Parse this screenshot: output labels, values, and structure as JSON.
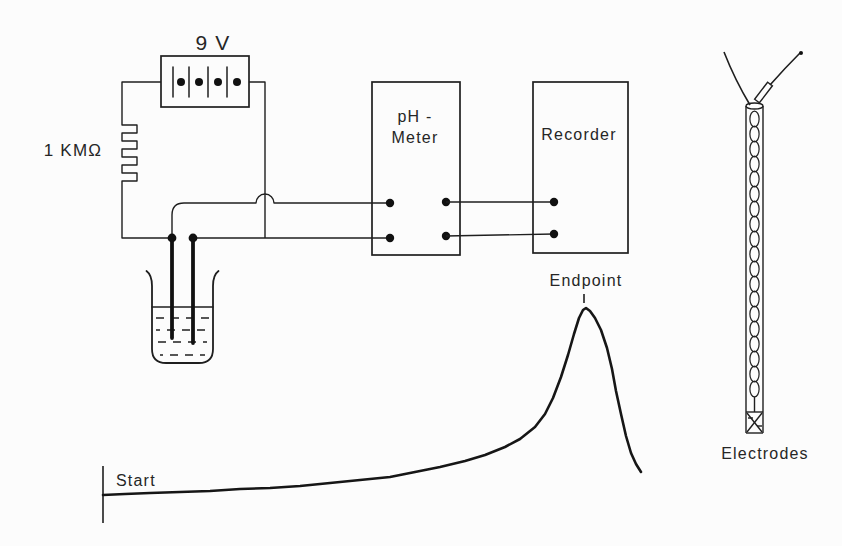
{
  "canvas": {
    "width": 842,
    "height": 546,
    "background": "#fcfcfc",
    "ink": "#1f1f1f"
  },
  "circuit": {
    "battery_label": "9 V",
    "resistor_label": "1 KMΩ",
    "ph_meter": {
      "line1": "pH -",
      "line2": "Meter"
    },
    "recorder": {
      "label": "Recorder"
    }
  },
  "trace": {
    "start_label": "Start",
    "endpoint_label": "Endpoint",
    "points": [
      [
        103,
        495
      ],
      [
        125,
        494
      ],
      [
        150,
        493
      ],
      [
        180,
        492
      ],
      [
        210,
        491
      ],
      [
        240,
        489
      ],
      [
        270,
        488
      ],
      [
        300,
        486
      ],
      [
        330,
        483
      ],
      [
        360,
        480
      ],
      [
        390,
        477
      ],
      [
        415,
        472
      ],
      [
        440,
        467
      ],
      [
        465,
        461
      ],
      [
        485,
        455
      ],
      [
        505,
        447
      ],
      [
        520,
        439
      ],
      [
        535,
        427
      ],
      [
        545,
        414
      ],
      [
        553,
        398
      ],
      [
        561,
        377
      ],
      [
        568,
        355
      ],
      [
        574,
        334
      ],
      [
        579,
        318
      ],
      [
        583,
        310
      ],
      [
        586,
        308
      ],
      [
        590,
        311
      ],
      [
        595,
        318
      ],
      [
        601,
        330
      ],
      [
        607,
        348
      ],
      [
        612,
        369
      ],
      [
        616,
        391
      ],
      [
        621,
        414
      ],
      [
        626,
        436
      ],
      [
        631,
        453
      ],
      [
        636,
        464
      ],
      [
        641,
        472
      ]
    ]
  },
  "electrode_assembly": {
    "label": "Electrodes"
  }
}
